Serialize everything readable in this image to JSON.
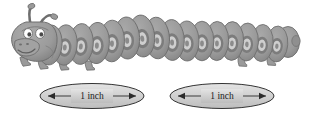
{
  "figure": {
    "kind": "illustration"
  },
  "creature": {
    "name": "caterpillar",
    "head": {
      "name": "head",
      "antennae_count": 2,
      "eyes_count": 2,
      "eye_color": "#ffffff",
      "pupil_color": "#4a4a4a"
    },
    "segments": {
      "ringed_count": 15,
      "tail_tip": 1,
      "ring_outer_color": "#7f7f7f",
      "ring_inner_color": "#cfcfcf"
    },
    "legs_count": 6,
    "body_color": "#9a9a9a",
    "body_shade": "#858585",
    "outline_color": "#5a5a5a"
  },
  "measurements": [
    {
      "id": "left-measure",
      "label": "1 inch",
      "value": 1,
      "unit": "inch",
      "arrow": "double-headed",
      "fill": "#d5d5d5",
      "stroke": "#333333"
    },
    {
      "id": "right-measure",
      "label": "1 inch",
      "value": 1,
      "unit": "inch",
      "arrow": "double-headed",
      "fill": "#d5d5d5",
      "stroke": "#333333"
    }
  ],
  "colors": {
    "background": "#ffffff",
    "ink": "#1a1a1a",
    "body": "#9a9a9a",
    "ring_light": "#cfcfcf",
    "ring_dark": "#7f7f7f"
  }
}
